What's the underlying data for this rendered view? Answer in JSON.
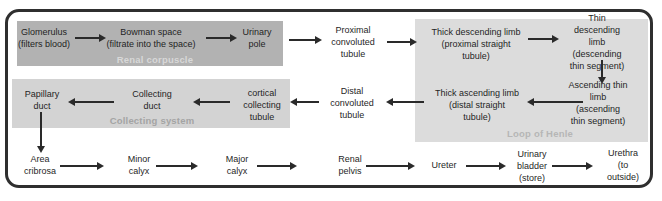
{
  "figure": {
    "renal_corpuscle": {
      "label": "Renal corpuscle",
      "glomerulus": "Glomerulus\n(filters blood)",
      "bowman_space": "Bowman space\n(filtrate into the space)",
      "urinary_pole": "Urinary\npole"
    },
    "proximal_convoluted_tubule": "Proximal\nconvoluted\ntubule",
    "loop_of_henle": {
      "label": "Loop of Henle",
      "thick_descending": "Thick descending limb\n(proximal straight\ntubule)",
      "thin_descending": "Thin descending limb\n(descending\nthin segment)",
      "ascending_thin": "Ascending thin limb\n(ascending\nthin segment)",
      "thick_ascending": "Thick ascending limb\n(distal straight\ntubule)"
    },
    "distal_convoluted_tubule": "Distal\nconvoluted\ntubule",
    "collecting_system": {
      "label": "Collecting system",
      "cortical_collecting_tubule": "cortical\ncollecting\ntubule",
      "collecting_duct": "Collecting\nduct",
      "papillary_duct": "Papillary\nduct"
    },
    "lower_tract": {
      "area_cribrosa": "Area\ncribrosa",
      "minor_calyx": "Minor\ncalyx",
      "major_calyx": "Major\ncalyx",
      "renal_pelvis": "Renal\npelvis",
      "ureter": "Ureter",
      "urinary_bladder": "Urinary\nbladder\n(store)",
      "urethra": "Urethra\n(to outside)"
    },
    "connections": [
      "glomerulus → bowman_space",
      "bowman_space → urinary_pole",
      "urinary_pole → proximal_convoluted_tubule",
      "proximal_convoluted_tubule → thick_descending_limb",
      "thick_descending_limb → thin_descending_limb",
      "thin_descending_limb → ascending_thin_limb",
      "ascending_thin_limb → thick_ascending_limb",
      "thick_ascending_limb → distal_convoluted_tubule",
      "distal_convoluted_tubule → cortical_collecting_tubule",
      "cortical_collecting_tubule → collecting_duct",
      "collecting_duct → papillary_duct",
      "papillary_duct → area_cribrosa",
      "area_cribrosa → minor_calyx",
      "minor_calyx → major_calyx",
      "major_calyx → renal_pelvis",
      "renal_pelvis → ureter",
      "ureter → urinary_bladder",
      "urinary_bladder → urethra"
    ]
  },
  "colors": {
    "canvas_background": "#ffffff",
    "frame_border": "#2f2f2f",
    "arrow": "#2a2a2a",
    "text": "#1f1f1f",
    "renal_corpuscle_box": "#b2b2b2",
    "renal_corpuscle_label": "#d8d8d8",
    "collecting_system_box": "#d3d3d3",
    "collecting_system_label": "#a4a4a4",
    "loop_of_henle_box": "#dcdcdc",
    "loop_of_henle_label": "#b6b6b6"
  }
}
